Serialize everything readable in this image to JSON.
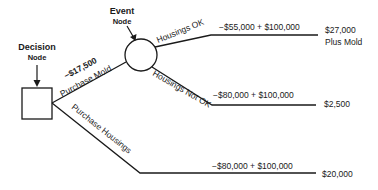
{
  "diagram": {
    "type": "decision-tree",
    "nodes": {
      "decision": {
        "label_line1": "Decision",
        "label_line2": "Node"
      },
      "event": {
        "label_line1": "Event",
        "label_line2": "Node"
      }
    },
    "branches": {
      "purchase_mold": {
        "label": "Purchase Mold",
        "cost": "−$17,500"
      },
      "purchase_housings": {
        "label": "Purchase Housings"
      },
      "housings_ok": {
        "label": "Housings OK",
        "calc": "−$55,000  +  $100,000",
        "outcome": "$27,000",
        "outcome_note": "Plus Mold"
      },
      "housings_not_ok": {
        "label": "Housings Not OK",
        "calc": "−$80,000  +  $100,000",
        "outcome": "$2,500"
      },
      "housings_bottom": {
        "calc": "−$80,000  +  $100,000",
        "outcome": "$20,000"
      }
    },
    "colors": {
      "line": "#1a1a1a",
      "background": "#ffffff"
    }
  }
}
